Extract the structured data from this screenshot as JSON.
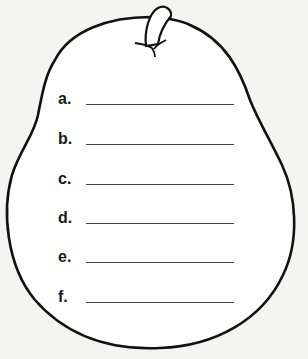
{
  "worksheet": {
    "shape": "pear",
    "items": [
      {
        "label": "a.",
        "value": ""
      },
      {
        "label": "b.",
        "value": ""
      },
      {
        "label": "c.",
        "value": ""
      },
      {
        "label": "d.",
        "value": ""
      },
      {
        "label": "e.",
        "value": ""
      },
      {
        "label": "f.",
        "value": ""
      }
    ]
  }
}
